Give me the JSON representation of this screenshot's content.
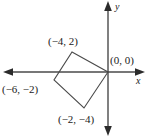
{
  "figure": {
    "stroke_color": "#4a4a4a",
    "text_color": "#1a1a1a",
    "background_color": "#ffffff"
  },
  "axes": {
    "x_label": "x",
    "y_label": "y",
    "origin_px": [
      108,
      72
    ],
    "x_axis_y_px": 72,
    "y_axis_x_px": 108
  },
  "chart_data": {
    "type": "scatter",
    "title": "",
    "xlabel": "x",
    "ylabel": "y",
    "grid": false,
    "legend": "none",
    "shape": "square",
    "vertex_labels": [
      "(-4, 2)",
      "(0, 0)",
      "(-2, -4)",
      "(-6, -2)"
    ],
    "vertices": [
      {
        "label": "(-4, 2)",
        "x": -4,
        "y": 2,
        "px": [
          72,
          52
        ]
      },
      {
        "label": "(0, 0)",
        "x": 0,
        "y": 0,
        "px": [
          108,
          72
        ]
      },
      {
        "label": "(-2, -4)",
        "x": -2,
        "y": -4,
        "px": [
          84,
          108
        ]
      },
      {
        "label": "(-6, -2)",
        "x": -6,
        "y": -2,
        "px": [
          54,
          80
        ]
      }
    ],
    "edges": [
      [
        0,
        1
      ],
      [
        1,
        2
      ],
      [
        2,
        3
      ],
      [
        3,
        0
      ]
    ],
    "xlim": [
      -7.5,
      1.5
    ],
    "ylim": [
      -5.5,
      4.5
    ]
  },
  "labels": {
    "top": "(−4, 2)",
    "left": "(−6, −2)",
    "origin": "(0, 0)",
    "bottom": "(−2, −4)",
    "x_axis": "x",
    "y_axis": "y"
  }
}
